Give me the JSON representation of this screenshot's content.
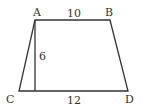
{
  "figure": {
    "type": "trapezoid",
    "stroke_color": "#333333",
    "vertices": {
      "A": {
        "label": "A",
        "x": 35,
        "y": 20
      },
      "B": {
        "label": "B",
        "x": 110,
        "y": 20
      },
      "C": {
        "label": "C",
        "x": 19,
        "y": 91
      },
      "D": {
        "label": "D",
        "x": 128,
        "y": 91
      }
    },
    "altitude": {
      "from": "A",
      "foot_x": 35,
      "foot_y": 91
    },
    "measurements": {
      "top_base_AB": "10",
      "height": "6",
      "bottom_base_CD": "12"
    }
  }
}
